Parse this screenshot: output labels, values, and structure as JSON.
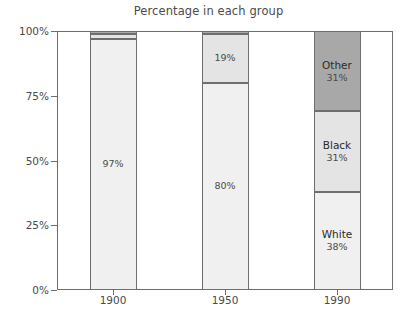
{
  "chart_data": {
    "type": "bar",
    "subtype": "stacked-percentage",
    "title": "Percentage in each group",
    "xlabel": "",
    "ylabel": "",
    "categories": [
      "1900",
      "1950",
      "1990"
    ],
    "ylim": [
      0,
      100
    ],
    "ytick_labels": [
      "0%",
      "25%",
      "50%",
      "75%",
      "100%"
    ],
    "ytick_values": [
      0,
      25,
      50,
      75,
      100
    ],
    "grid": false,
    "legend": "none (segments labeled in-place on 1990 bar)",
    "series": [
      {
        "name": "White",
        "color": "#f0f0f0",
        "values": [
          97,
          80,
          38
        ],
        "labels": [
          "97%",
          "80%",
          "38%"
        ]
      },
      {
        "name": "Black",
        "color": "#e4e4e4",
        "values": [
          2,
          19,
          31
        ],
        "labels": [
          "",
          "19%",
          "31%"
        ]
      },
      {
        "name": "Other",
        "color": "#a8a8a8",
        "values": [
          1,
          1,
          31
        ],
        "labels": [
          "",
          "",
          "31%"
        ]
      }
    ],
    "bars": [
      {
        "category": "1900",
        "segments": [
          {
            "name": "White",
            "value": 97,
            "value_label": "97%",
            "name_label": "",
            "color": "#f0f0f0",
            "show_name": false,
            "show_value": true
          },
          {
            "name": "Black",
            "value": 2,
            "value_label": "",
            "name_label": "",
            "color": "#e4e4e4",
            "show_name": false,
            "show_value": false
          },
          {
            "name": "Other",
            "value": 1,
            "value_label": "",
            "name_label": "",
            "color": "#a8a8a8",
            "show_name": false,
            "show_value": false
          }
        ]
      },
      {
        "category": "1950",
        "segments": [
          {
            "name": "White",
            "value": 80,
            "value_label": "80%",
            "name_label": "",
            "color": "#f0f0f0",
            "show_name": false,
            "show_value": true
          },
          {
            "name": "Black",
            "value": 19,
            "value_label": "19%",
            "name_label": "",
            "color": "#e4e4e4",
            "show_name": false,
            "show_value": true
          },
          {
            "name": "Other",
            "value": 1,
            "value_label": "",
            "name_label": "",
            "color": "#a8a8a8",
            "show_name": false,
            "show_value": false
          }
        ]
      },
      {
        "category": "1990",
        "segments": [
          {
            "name": "White",
            "value": 38,
            "value_label": "38%",
            "name_label": "White",
            "color": "#f0f0f0",
            "show_name": true,
            "show_value": true
          },
          {
            "name": "Black",
            "value": 31,
            "value_label": "31%",
            "name_label": "Black",
            "color": "#e4e4e4",
            "show_name": true,
            "show_value": true
          },
          {
            "name": "Other",
            "value": 31,
            "value_label": "31%",
            "name_label": "Other",
            "color": "#a8a8a8",
            "show_name": true,
            "show_value": true
          }
        ]
      }
    ]
  },
  "colors": {
    "axis": "#6e6e6e",
    "text": "#4a4a4a",
    "label_text": "#2b2b2b",
    "background": "#ffffff",
    "white_group": "#f0f0f0",
    "black_group": "#e4e4e4",
    "other_group": "#a8a8a8"
  }
}
